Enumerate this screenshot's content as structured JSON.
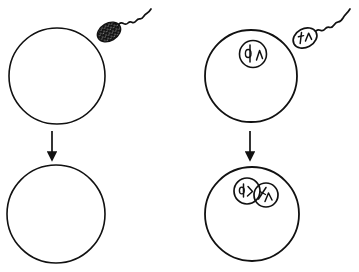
{
  "figure": {
    "background_color": "#ffffff",
    "ink_color": "#111111",
    "stipple_color_light": "#1a1a1a",
    "stipple_color_dense": "#2a2a2a",
    "width": 359,
    "height": 272
  },
  "panels": [
    {
      "id": "top-left",
      "name": "unfertilized-egg-stippled",
      "label": "",
      "cell": {
        "shape": "circle",
        "cx": 57,
        "cy": 76,
        "r": 48,
        "fill_style": "stipple-light",
        "stroke_width": 1.6
      },
      "sperm": {
        "present": true,
        "head_style": "solid-filled",
        "head_cx": 109,
        "head_cy": 32,
        "head_rx": 12,
        "head_ry": 8.5,
        "head_rotation_deg": -28,
        "tail_style": "wavy",
        "tail_end_x": 151,
        "tail_end_y": 9,
        "chromosomes_visible": false
      },
      "nucleus": {
        "present": false
      }
    },
    {
      "id": "top-right",
      "name": "unfertilized-egg-with-nucleus",
      "label": "",
      "cell": {
        "shape": "circle",
        "cx": 251,
        "cy": 76,
        "r": 46,
        "fill_style": "none",
        "stroke_width": 1.8
      },
      "sperm": {
        "present": true,
        "head_style": "outlined",
        "head_cx": 305,
        "head_cy": 38,
        "head_rx": 12,
        "head_ry": 9,
        "head_rotation_deg": -28,
        "tail_style": "wavy",
        "tail_end_x": 350,
        "tail_end_y": 9,
        "chromosomes_visible": true
      },
      "nucleus": {
        "present": true,
        "count": 1,
        "cx": 253,
        "cy": 54,
        "r": 13,
        "chromosomes": [
          "loop-rod",
          "lambda"
        ]
      }
    },
    {
      "id": "bottom-left",
      "name": "fertilized-egg-stippled",
      "label": "",
      "cell": {
        "shape": "circle",
        "cx": 56,
        "cy": 214,
        "r": 49,
        "fill_style": "stipple-dense",
        "stroke_width": 1.6
      },
      "sperm": {
        "present": false
      },
      "nucleus": {
        "present": false
      },
      "arrow": {
        "present": true,
        "x": 52,
        "y_start": 131,
        "y_end": 162,
        "direction": "down"
      }
    },
    {
      "id": "bottom-right",
      "name": "zygote-with-fused-nuclei",
      "label": "",
      "cell": {
        "shape": "circle",
        "cx": 252,
        "cy": 214,
        "r": 47,
        "fill_style": "none",
        "stroke_width": 1.8
      },
      "sperm": {
        "present": false
      },
      "nucleus": {
        "present": true,
        "count": 2,
        "fused": true,
        "nuclei": [
          {
            "cx": 247,
            "cy": 191,
            "r": 13,
            "chromosomes": [
              "loop-rod",
              "check"
            ]
          },
          {
            "cx": 266,
            "cy": 195,
            "r": 12,
            "chromosomes": [
              "rod-slash",
              "lambda"
            ]
          }
        ]
      },
      "arrow": {
        "present": true,
        "x": 250,
        "y_start": 131,
        "y_end": 162,
        "direction": "down"
      }
    }
  ],
  "arrows": [
    {
      "name": "left-transition-arrow",
      "x": 52,
      "y_start": 131,
      "y_end": 162
    },
    {
      "name": "right-transition-arrow",
      "x": 250,
      "y_start": 131,
      "y_end": 162
    }
  ],
  "chart_data": {
    "type": "diagram",
    "columns": [
      "cytoplasm view (stippled)",
      "nuclear view (chromosomes)"
    ],
    "rows": [
      "before fertilization",
      "after fertilization"
    ],
    "elements": [
      "egg cell",
      "sperm cell",
      "egg nucleus",
      "sperm nucleus",
      "fused pronuclei",
      "transition arrow"
    ]
  }
}
